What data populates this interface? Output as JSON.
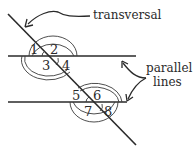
{
  "diagram": {
    "labels": {
      "transversal": "transversal",
      "parallel_line1": "parallel",
      "parallel_line2": "lines"
    },
    "angles": [
      "1",
      "2",
      "3",
      "4",
      "5",
      "6",
      "7",
      "8"
    ],
    "colors": {
      "line": "#2a2a2a",
      "arc": "#3a3a3a",
      "background": "#ffffff"
    }
  }
}
